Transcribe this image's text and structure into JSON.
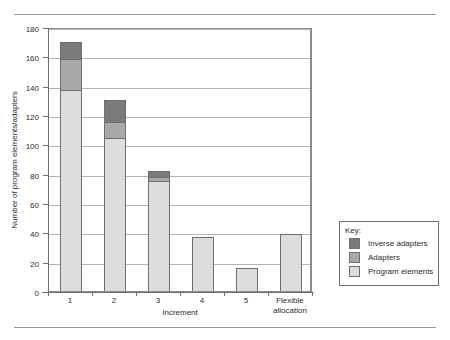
{
  "chart_data": {
    "type": "bar",
    "stacked": true,
    "title": "",
    "xlabel": "Increment",
    "ylabel": "Number of program elements/adapters",
    "categories": [
      "1",
      "2",
      "3",
      "4",
      "5",
      "Flexible allocation"
    ],
    "ylim": [
      0,
      180
    ],
    "yticks": [
      0,
      20,
      40,
      60,
      80,
      100,
      120,
      140,
      160,
      180
    ],
    "grid": true,
    "legend_position": "outside-right-bottom",
    "legend_title": "Key:",
    "series": [
      {
        "name": "Program elements",
        "color": "#dddddd",
        "values": [
          137,
          104,
          75,
          37,
          16,
          39
        ]
      },
      {
        "name": "Adapters",
        "color": "#a9a9a9",
        "values": [
          21,
          11,
          3,
          0,
          0,
          0
        ]
      },
      {
        "name": "Inverse adapters",
        "color": "#7b7b7b",
        "values": [
          12,
          15,
          4,
          0,
          0,
          0
        ]
      }
    ],
    "totals": [
      170,
      130,
      82,
      37,
      16,
      39
    ]
  },
  "axes": {
    "y_tick_labels": [
      "180",
      "160",
      "140",
      "120",
      "100",
      "80",
      "60",
      "40",
      "20",
      "0"
    ],
    "y_axis_title": "Number of program elements/adapters",
    "x_axis_title": "Increment",
    "x_tick_labels": [
      "1",
      "2",
      "3",
      "4",
      "5",
      "Flexible allocation"
    ]
  },
  "legend": {
    "title": "Key:",
    "items": [
      {
        "label": "Inverse adapters",
        "color": "#7b7b7b",
        "swatch": "inverse-adapters-swatch"
      },
      {
        "label": "Adapters",
        "color": "#a9a9a9",
        "swatch": "adapters-swatch"
      },
      {
        "label": "Program elements",
        "color": "#dddddd",
        "swatch": "program-elements-swatch"
      }
    ]
  },
  "bars": [
    {
      "label": "1",
      "label_line2": "",
      "total": 170
    },
    {
      "label": "2",
      "label_line2": "",
      "total": 130
    },
    {
      "label": "3",
      "label_line2": "",
      "total": 82
    },
    {
      "label": "4",
      "label_line2": "",
      "total": 37
    },
    {
      "label": "5",
      "label_line2": "",
      "total": 16
    },
    {
      "label": "Flexible",
      "label_line2": "allocation",
      "total": 39
    }
  ]
}
